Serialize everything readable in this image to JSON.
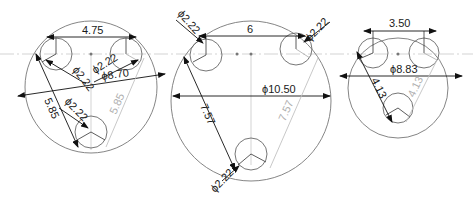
{
  "drawing": {
    "views": [
      {
        "id": "left",
        "outer_diameter": "ϕ8.70",
        "hole_spacing": "4.75",
        "hole_diameters": [
          "ϕ2.22",
          "ϕ2.22",
          "ϕ2.22"
        ],
        "side_length": "5.85",
        "side_length_ghost": "5.85"
      },
      {
        "id": "middle",
        "outer_diameter": "ϕ10.50",
        "hole_spacing": "6",
        "hole_diameters": [
          "ϕ2.22",
          "ϕ2.22",
          "ϕ2.22"
        ],
        "side_length": "7.57",
        "side_length_ghost": "7.57"
      },
      {
        "id": "right",
        "outer_diameter": "ϕ8.83",
        "hole_spacing": "3.50",
        "side_length": "4.13",
        "side_length_ghost": "4.13"
      }
    ],
    "colors": {
      "line": "#555555",
      "dim_line": "#111111",
      "ghost": "#b5b5b5",
      "center_line": "#bdbdbd"
    }
  }
}
